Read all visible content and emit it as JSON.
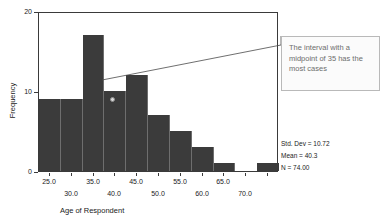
{
  "chart_data": {
    "type": "bar",
    "title": "",
    "subtitle": "",
    "xlabel": "Age of Respondent",
    "ylabel": "Frequency",
    "xlim": [
      22.5,
      77.5
    ],
    "ylim": [
      0,
      20
    ],
    "grid": false,
    "legend": "none",
    "bin_width": 5,
    "categories": [
      "25.0",
      "30.0",
      "35.0",
      "40.0",
      "45.0",
      "50.0",
      "55.0",
      "60.0",
      "65.0",
      "70.0",
      "75.0"
    ],
    "midpoints": [
      25,
      30,
      35,
      40,
      45,
      50,
      55,
      60,
      65,
      70,
      75
    ],
    "values": [
      9,
      9,
      17,
      10,
      12,
      7,
      5,
      3,
      1,
      0,
      1
    ],
    "y_ticks": [
      "0",
      "10",
      "20"
    ],
    "y_tick_values": [
      0,
      10,
      20
    ],
    "x_ticks_upper": [
      "25.0",
      "35.0",
      "45.0",
      "55.0",
      "65.0"
    ],
    "x_ticks_lower": [
      "30.0",
      "40.0",
      "50.0",
      "60.0",
      "70.0"
    ],
    "x_tick_values_upper": [
      25,
      35,
      45,
      55,
      65
    ],
    "x_tick_values_lower": [
      30,
      40,
      50,
      60,
      70
    ],
    "bar_color": "#3b3b3b",
    "axis_color": "#3a3a3a",
    "annotations": [
      {
        "text": "The interval with a midpoint of 35 has the most cases",
        "points_to_midpoint": 35,
        "points_to_value": 12
      }
    ]
  },
  "axes": {
    "y_title": "Frequency",
    "x_title": "Age of Respondent"
  },
  "stats": {
    "std_dev": "Std. Dev = 10.72",
    "mean": "Mean = 40.3",
    "n": "N = 74.00"
  },
  "callout": {
    "text": "The interval with a midpoint of 35 has the most cases"
  }
}
